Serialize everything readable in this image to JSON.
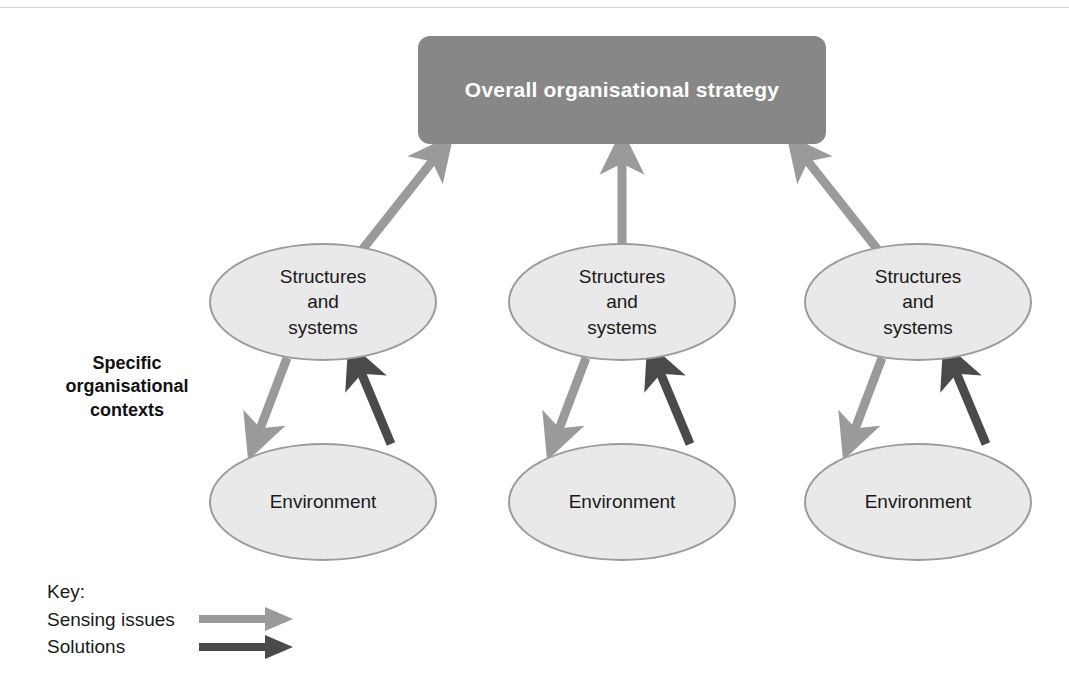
{
  "figure": {
    "background_color": "#ffffff"
  },
  "strategy": {
    "label": "Overall organisational strategy",
    "fill_color": "#878787",
    "text_color": "#ffffff"
  },
  "side_caption": {
    "line1": "Specific",
    "line2": "organisational",
    "line3": "contexts",
    "full_text": "Specific organisational contexts"
  },
  "columns": [
    {
      "id": "context-1",
      "structures": {
        "line1": "Structures",
        "line2": "and",
        "line3": "systems"
      },
      "environment": {
        "label": "Environment"
      }
    },
    {
      "id": "context-2",
      "structures": {
        "line1": "Structures",
        "line2": "and",
        "line3": "systems"
      },
      "environment": {
        "label": "Environment"
      }
    },
    {
      "id": "context-3",
      "structures": {
        "line1": "Structures",
        "line2": "and",
        "line3": "systems"
      },
      "environment": {
        "label": "Environment"
      }
    }
  ],
  "node_style": {
    "fill_color": "#e9e9e9",
    "border_color": "#9b9b9b",
    "text_color": "#1a1a1a"
  },
  "key": {
    "title": "Key:",
    "items": [
      {
        "label": "Sensing issues",
        "color": "#9a9a9a",
        "icon": "right-arrow-icon"
      },
      {
        "label": "Solutions",
        "color": "#4a4a4a",
        "icon": "right-arrow-icon"
      }
    ]
  },
  "arrows": {
    "sensing_color": "#9a9a9a",
    "solutions_color": "#4a4a4a",
    "to_strategy": [
      {
        "from": "context-1-structures",
        "to": "strategy-box",
        "type": "sensing issues"
      },
      {
        "from": "context-2-structures",
        "to": "strategy-box",
        "type": "sensing issues"
      },
      {
        "from": "context-3-structures",
        "to": "strategy-box",
        "type": "sensing issues"
      }
    ],
    "within_context": [
      {
        "from": "structures-and-systems",
        "to": "environment",
        "type": "sensing issues"
      },
      {
        "from": "environment",
        "to": "structures-and-systems",
        "type": "solutions"
      }
    ]
  }
}
